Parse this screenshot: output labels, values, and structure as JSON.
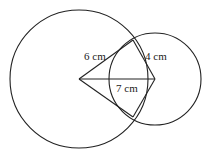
{
  "diagram": {
    "type": "two intersecting circles with kite",
    "big_circle": {
      "cx": 79,
      "cy": 79,
      "r": 69
    },
    "small_circle": {
      "cx": 155,
      "cy": 79,
      "r": 46
    },
    "intersection_top": {
      "x": 133,
      "y": 40
    },
    "intersection_bottom": {
      "x": 133,
      "y": 117
    },
    "labels": {
      "radius_big": "6 cm",
      "radius_small": "4 cm",
      "center_distance": "7 cm"
    },
    "stroke_color": "#222222"
  }
}
